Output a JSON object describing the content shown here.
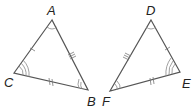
{
  "diagram": {
    "triangles": [
      {
        "name": "ABC",
        "vertices": [
          {
            "label": "A",
            "angle_arcs": 1
          },
          {
            "label": "B",
            "angle_arcs": 2
          },
          {
            "label": "C",
            "angle_arcs": 3
          }
        ],
        "sides": [
          {
            "name": "AC",
            "ticks": 1
          },
          {
            "name": "CB",
            "ticks": 2
          },
          {
            "name": "AB",
            "ticks": 3
          }
        ]
      },
      {
        "name": "DEF",
        "vertices": [
          {
            "label": "D",
            "angle_arcs": 1
          },
          {
            "label": "E",
            "angle_arcs": 3
          },
          {
            "label": "F",
            "angle_arcs": 2
          }
        ],
        "sides": [
          {
            "name": "DE",
            "ticks": 1
          },
          {
            "name": "FE",
            "ticks": 2
          },
          {
            "name": "DF",
            "ticks": 3
          }
        ]
      }
    ],
    "colors": {
      "stroke": "#555555",
      "label": "#222222"
    }
  }
}
